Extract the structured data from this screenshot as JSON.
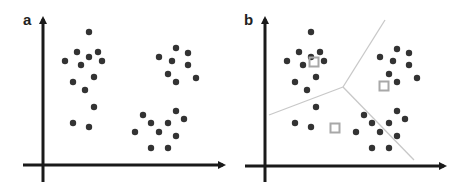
{
  "figure": {
    "width": 470,
    "height": 190,
    "colors": {
      "background": "#ffffff",
      "axis": "#1a1a1a",
      "point": "#333333",
      "boundary": "#c8c8c8",
      "centroid": "#a8a8a8"
    }
  },
  "panels": [
    {
      "id": "a",
      "label": "a",
      "label_pos": [
        23,
        25
      ],
      "axes": {
        "origin_x": 43,
        "origin_y": 165,
        "y_top": 14,
        "y_bottom": 182,
        "x_left": 23,
        "x_right": 228
      },
      "points": [
        [
          89,
          32
        ],
        [
          77,
          52
        ],
        [
          89,
          57
        ],
        [
          98,
          52
        ],
        [
          65,
          61
        ],
        [
          81,
          65
        ],
        [
          102,
          61
        ],
        [
          73,
          82
        ],
        [
          94,
          77
        ],
        [
          85,
          90
        ],
        [
          94,
          107
        ],
        [
          73,
          123
        ],
        [
          89,
          127
        ],
        [
          176,
          48
        ],
        [
          188,
          53
        ],
        [
          159,
          57
        ],
        [
          172,
          61
        ],
        [
          188,
          65
        ],
        [
          168,
          74
        ],
        [
          196,
          78
        ],
        [
          176,
          82
        ],
        [
          176,
          111
        ],
        [
          143,
          115
        ],
        [
          184,
          119
        ],
        [
          151,
          123
        ],
        [
          168,
          123
        ],
        [
          135,
          132
        ],
        [
          159,
          132
        ],
        [
          176,
          136
        ],
        [
          151,
          148
        ],
        [
          168,
          148
        ]
      ],
      "centroids": [],
      "boundaries": []
    },
    {
      "id": "b",
      "label": "b",
      "label_pos": [
        244,
        25
      ],
      "axes": {
        "origin_x": 265,
        "origin_y": 166,
        "y_top": 14,
        "y_bottom": 182,
        "x_left": 245,
        "x_right": 449
      },
      "points": [
        [
          311,
          32
        ],
        [
          299,
          52
        ],
        [
          311,
          57
        ],
        [
          320,
          52
        ],
        [
          287,
          61
        ],
        [
          303,
          65
        ],
        [
          324,
          61
        ],
        [
          295,
          82
        ],
        [
          316,
          77
        ],
        [
          307,
          90
        ],
        [
          316,
          107
        ],
        [
          295,
          123
        ],
        [
          311,
          127
        ],
        [
          397,
          49
        ],
        [
          409,
          53
        ],
        [
          380,
          57
        ],
        [
          393,
          61
        ],
        [
          409,
          65
        ],
        [
          389,
          74
        ],
        [
          417,
          78
        ],
        [
          397,
          82
        ],
        [
          397,
          111
        ],
        [
          364,
          115
        ],
        [
          405,
          119
        ],
        [
          372,
          123
        ],
        [
          389,
          123
        ],
        [
          356,
          132
        ],
        [
          380,
          132
        ],
        [
          397,
          136
        ],
        [
          372,
          148
        ],
        [
          389,
          148
        ]
      ],
      "centroids": [
        [
          314,
          62
        ],
        [
          384,
          86
        ],
        [
          335,
          128
        ]
      ],
      "boundaries": [
        [
          [
            343,
            87
          ],
          [
            385,
            20
          ]
        ],
        [
          [
            343,
            87
          ],
          [
            269,
            115
          ]
        ],
        [
          [
            343,
            87
          ],
          [
            414,
            160
          ]
        ]
      ]
    }
  ]
}
